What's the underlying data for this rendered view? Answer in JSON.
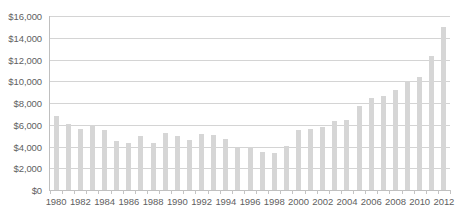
{
  "chart_data": {
    "type": "bar",
    "title": "",
    "xlabel": "",
    "ylabel": "",
    "ylim": [
      0,
      16000
    ],
    "ytick_step": 2000,
    "grid": true,
    "legend": null,
    "bar_color": "#d6d6d6",
    "gridline_color": "#d4d4d4",
    "axis_color": "#bfbfbf",
    "label_color": "#5f5f5f",
    "ytick_labels": [
      "$16,000",
      "$14,000",
      "$12,000",
      "$10,000",
      "$8,000",
      "$6,000",
      "$4,000",
      "$2,000",
      "$0"
    ],
    "ytick_values": [
      16000,
      14000,
      12000,
      10000,
      8000,
      6000,
      4000,
      2000,
      0
    ],
    "xtick_labels": [
      "1980",
      "1982",
      "1984",
      "1986",
      "1988",
      "1990",
      "1992",
      "1994",
      "1996",
      "1998",
      "2000",
      "2002",
      "2004",
      "2006",
      "2008",
      "2010",
      "2012"
    ],
    "categories": [
      "1980",
      "1981",
      "1982",
      "1983",
      "1984",
      "1985",
      "1986",
      "1987",
      "1988",
      "1989",
      "1990",
      "1991",
      "1992",
      "1993",
      "1994",
      "1995",
      "1996",
      "1997",
      "1998",
      "1999",
      "2000",
      "2001",
      "2002",
      "2003",
      "2004",
      "2005",
      "2006",
      "2007",
      "2008",
      "2009",
      "2010",
      "2011",
      "2012"
    ],
    "values": [
      6800,
      6100,
      5650,
      5950,
      5550,
      4550,
      4300,
      5000,
      4350,
      5250,
      4980,
      4600,
      5150,
      5100,
      4650,
      3850,
      3980,
      3450,
      3430,
      4050,
      5550,
      5650,
      5820,
      6350,
      6430,
      7680,
      8430,
      8680,
      9230,
      10000,
      10420,
      12300,
      15000
    ]
  }
}
